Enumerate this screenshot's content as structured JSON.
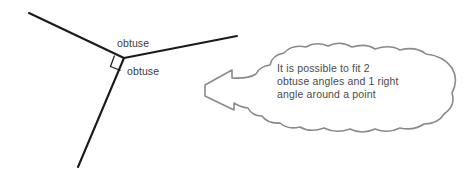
{
  "canvas": {
    "width": 473,
    "height": 175,
    "background_color": "#ffffff"
  },
  "figure": {
    "name": "angles-around-a-point-diagram",
    "ray_color": "#1a1a1a",
    "ray_width": 2.1,
    "vertex": {
      "x": 124,
      "y": 58
    },
    "rays": [
      {
        "name": "ray-upper-left",
        "x1": 124,
        "y1": 58,
        "x2": 29,
        "y2": 13
      },
      {
        "name": "ray-right",
        "x1": 124,
        "y1": 58,
        "x2": 237,
        "y2": 36
      },
      {
        "name": "ray-lower-left",
        "x1": 124,
        "y1": 58,
        "x2": 78,
        "y2": 167
      }
    ],
    "right_angle_marker": {
      "name": "right-angle-square-marker",
      "points": "114.5,55.5 110.5,66.5 120.5,70.5",
      "color": "#1a1a1a",
      "width": 1.2
    }
  },
  "labels": {
    "upper": {
      "text": "obtuse",
      "x": 117,
      "y": 47
    },
    "lower": {
      "text": "obtuse",
      "x": 127,
      "y": 75
    },
    "color": "#3a3a3a"
  },
  "callout": {
    "name": "cloud-callout",
    "outline_color": "#8a8a8a",
    "fill_color": "#ffffff",
    "stroke_width": 1.6,
    "arrow_tip": {
      "x": 205,
      "y": 85
    },
    "path": "M 205 85 L 232 70 L 232 78 Q 248 79 256 74 Q 260 66 270 65 Q 272 55 284 53 Q 292 44 306 47 Q 316 41 328 46 Q 340 40 352 47 Q 366 43 375 49 Q 390 44 400 50 Q 416 46 426 54 Q 444 56 452 68 Q 459 80 452 93 Q 456 106 444 114 Q 438 124 424 124 Q 414 131 400 128 Q 388 134 375 129 Q 362 135 350 129 Q 336 134 324 128 Q 310 133 300 127 Q 288 130 280 123 Q 268 124 262 116 Q 252 116 248 108 Q 240 107 234 103 L 234 110 L 205 96 Z",
    "text": {
      "lines": [
        "It is possible to fit 2",
        "obtuse angles and 1 right",
        "angle around a point"
      ],
      "x": 277,
      "y_start": 72,
      "line_height": 13,
      "color": "#4a4a4a"
    }
  }
}
